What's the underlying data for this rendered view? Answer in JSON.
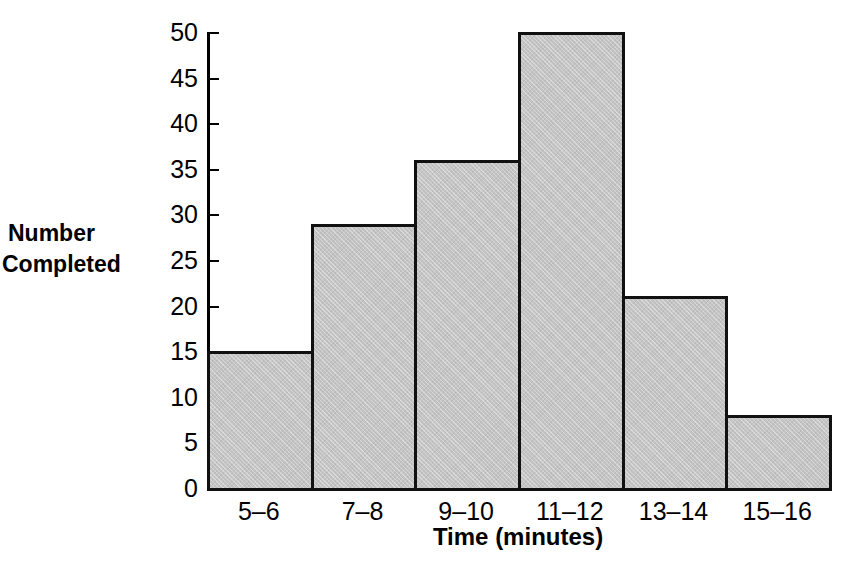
{
  "chart_data": {
    "type": "bar",
    "title": "",
    "subtitle": "",
    "xlabel": "Time (minutes)",
    "ylabel": "Number Completed",
    "ylabel_lines": [
      "Number",
      "Completed"
    ],
    "categories": [
      "5–6",
      "7–8",
      "9–10",
      "11–12",
      "13–14",
      "15–16"
    ],
    "values": [
      15,
      29,
      36,
      50,
      21,
      8
    ],
    "ylim": [
      0,
      50
    ],
    "ytick_step": 5,
    "yticks": [
      0,
      5,
      10,
      15,
      20,
      25,
      30,
      35,
      40,
      45,
      50
    ],
    "ytick_labels": [
      "0",
      "5",
      "10",
      "15",
      "20",
      "25",
      "30",
      "35",
      "40",
      "45",
      "50"
    ],
    "grid": false,
    "legend": null,
    "legend_position": "none",
    "bar_gap": 0,
    "bar_fill_color": "#c4c4c4",
    "bar_edge_color": "#111111",
    "axis_color": "#000000",
    "background_color": "#ffffff"
  }
}
